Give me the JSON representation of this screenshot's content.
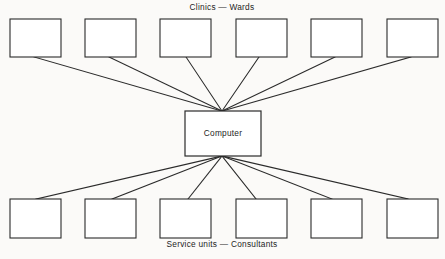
{
  "diagram": {
    "type": "star-network-topology",
    "background_color": "#fbfaf8",
    "line_color": "#2b2b2b",
    "box_fill": "#ffffff",
    "top_caption": "Clinics  —  Wards",
    "bottom_caption": "Service units  —  Consultants",
    "hub": {
      "label": "Computer",
      "x": 185,
      "y": 111,
      "width": 76,
      "height": 45,
      "top_port": {
        "x": 222,
        "y": 111
      },
      "bottom_port": {
        "x": 222,
        "y": 156
      }
    },
    "top_row": {
      "caption_position": {
        "x": 222,
        "y": 8
      },
      "box_width": 51,
      "box_height": 38,
      "box_y": 19,
      "nodes": [
        {
          "name": "clinic-ward-1",
          "x": 10,
          "label": "",
          "link_x": 34,
          "link_y": 57
        },
        {
          "name": "clinic-ward-2",
          "x": 85,
          "label": "",
          "link_x": 109,
          "link_y": 57
        },
        {
          "name": "clinic-ward-3",
          "x": 160,
          "label": "",
          "link_x": 186,
          "link_y": 57
        },
        {
          "name": "clinic-ward-4",
          "x": 236,
          "label": "",
          "link_x": 259,
          "link_y": 57
        },
        {
          "name": "clinic-ward-5",
          "x": 311,
          "label": "",
          "link_x": 335,
          "link_y": 57
        },
        {
          "name": "clinic-ward-6",
          "x": 387,
          "label": "",
          "link_x": 411,
          "link_y": 57
        }
      ]
    },
    "bottom_row": {
      "caption_position": {
        "x": 222,
        "y": 245
      },
      "box_width": 51,
      "box_height": 39,
      "box_y": 199,
      "nodes": [
        {
          "name": "service-unit-1",
          "x": 10,
          "label": "",
          "link_x": 36,
          "link_y": 199
        },
        {
          "name": "service-unit-2",
          "x": 85,
          "label": "",
          "link_x": 112,
          "link_y": 199
        },
        {
          "name": "service-unit-3",
          "x": 160,
          "label": "",
          "link_x": 188,
          "link_y": 199
        },
        {
          "name": "service-unit-4",
          "x": 236,
          "label": "",
          "link_x": 256,
          "link_y": 199
        },
        {
          "name": "service-unit-5",
          "x": 311,
          "label": "",
          "link_x": 332,
          "link_y": 199
        },
        {
          "name": "service-unit-6",
          "x": 387,
          "label": "",
          "link_x": 408,
          "link_y": 199
        }
      ]
    }
  }
}
